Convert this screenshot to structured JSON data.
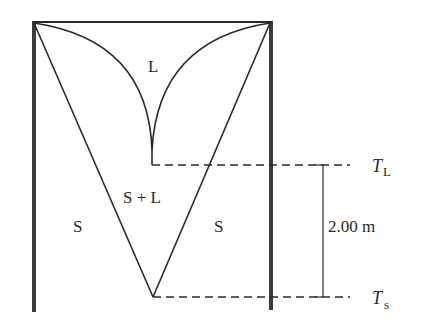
{
  "diagram": {
    "regions": {
      "liquid": "L",
      "mushy": "S + L",
      "solid_left": "S",
      "solid_right": "S"
    },
    "isotherms": {
      "liquidus": {
        "symbol": "T",
        "subscript": "L"
      },
      "solidus": {
        "symbol": "T",
        "subscript": "s"
      }
    },
    "dimension": {
      "label": "2.00 m"
    },
    "colors": {
      "line": "#2a2a2a",
      "wall": "#3a3a3a"
    }
  }
}
